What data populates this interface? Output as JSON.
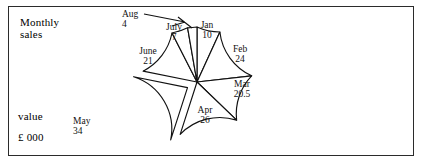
{
  "figure": {
    "axis_labels": {
      "y_top": "Monthly\nsales",
      "y_mid": "value",
      "y_units": "£ 000"
    }
  },
  "chart_data": {
    "type": "pie",
    "title": "",
    "xlabel": "",
    "ylabel": "Monthly sales value £ 000",
    "grid": false,
    "legend": "none",
    "exploded": [
      "May"
    ],
    "start_angle_deg": 90,
    "direction": "clockwise",
    "units": "£ 000",
    "total": 146.5,
    "categories": [
      "Jan",
      "Feb",
      "Mar",
      "Apr",
      "May",
      "June",
      "July",
      "Aug"
    ],
    "values": [
      10,
      24,
      20.5,
      26,
      34,
      21,
      7,
      4
    ],
    "labels": [
      {
        "name": "Jan",
        "value": "10",
        "x": 207,
        "y": 28,
        "anchor": "middle"
      },
      {
        "name": "Feb",
        "value": "24",
        "x": 240,
        "y": 52,
        "anchor": "middle"
      },
      {
        "name": "Mar",
        "value": "20.5",
        "x": 242,
        "y": 87,
        "anchor": "middle"
      },
      {
        "name": "Apr",
        "value": "26",
        "x": 205,
        "y": 113,
        "anchor": "middle"
      },
      {
        "name": "May",
        "value": "34",
        "x": 73,
        "y": 124,
        "anchor": "start"
      },
      {
        "name": "June",
        "value": "21",
        "x": 148,
        "y": 54,
        "anchor": "middle"
      },
      {
        "name": "July",
        "value": "7",
        "x": 174,
        "y": 30,
        "anchor": "middle"
      },
      {
        "name": "Aug",
        "value": "4",
        "x": 122,
        "y": 17,
        "anchor": "start"
      }
    ]
  }
}
